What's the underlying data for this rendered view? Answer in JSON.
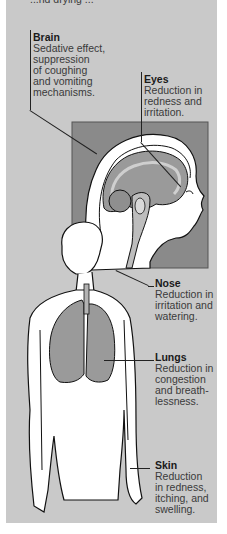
{
  "figure": {
    "cut_off_top_text": "...nd drying ...",
    "colors": {
      "panel_background": "#c9c9c9",
      "inset_background": "#8a8a8a",
      "outline": "#111111",
      "tissue_fill": "#9a9a9a"
    },
    "labels": [
      {
        "id": "brain",
        "title": "Brain",
        "description": "Sedative effect,\nsuppression\nof coughing\nand vomiting\nmechanisms."
      },
      {
        "id": "eyes",
        "title": "Eyes",
        "description": "Reduction in\nredness and\nirritation."
      },
      {
        "id": "nose",
        "title": "Nose",
        "description": "Reduction in\nirritation and\nwatering."
      },
      {
        "id": "lungs",
        "title": "Lungs",
        "description": "Reduction in\ncongestion\nand breath-\nlessness."
      },
      {
        "id": "skin",
        "title": "Skin",
        "description": "Reduction\nin redness,\nitching, and\nswelling."
      }
    ]
  }
}
